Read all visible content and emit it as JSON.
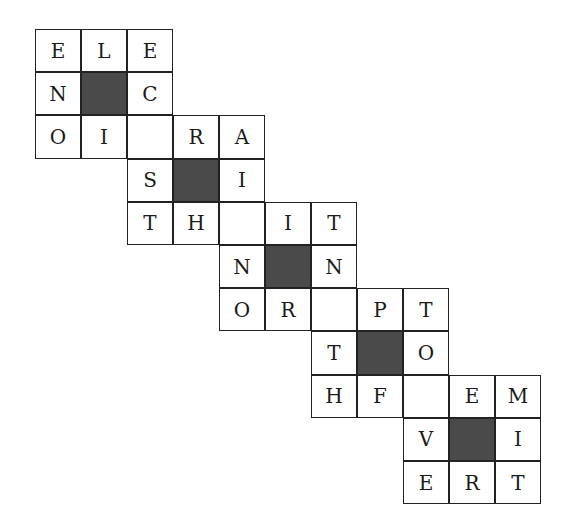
{
  "puzzle": {
    "cell_width": 46,
    "cell_height": 43.2,
    "shade_color": "#4a4a4a",
    "cells": [
      {
        "row": 0,
        "col": 0,
        "letter": "E"
      },
      {
        "row": 0,
        "col": 1,
        "letter": "L"
      },
      {
        "row": 0,
        "col": 2,
        "letter": "E"
      },
      {
        "row": 1,
        "col": 0,
        "letter": "N"
      },
      {
        "row": 1,
        "col": 1,
        "shaded": true
      },
      {
        "row": 1,
        "col": 2,
        "letter": "C"
      },
      {
        "row": 2,
        "col": 0,
        "letter": "O"
      },
      {
        "row": 2,
        "col": 1,
        "letter": "I"
      },
      {
        "row": 2,
        "col": 2,
        "letter": ""
      },
      {
        "row": 2,
        "col": 3,
        "letter": "R"
      },
      {
        "row": 2,
        "col": 4,
        "letter": "A"
      },
      {
        "row": 3,
        "col": 2,
        "letter": "S"
      },
      {
        "row": 3,
        "col": 3,
        "shaded": true
      },
      {
        "row": 3,
        "col": 4,
        "letter": "I"
      },
      {
        "row": 4,
        "col": 2,
        "letter": "T"
      },
      {
        "row": 4,
        "col": 3,
        "letter": "H"
      },
      {
        "row": 4,
        "col": 4,
        "letter": ""
      },
      {
        "row": 4,
        "col": 5,
        "letter": "I"
      },
      {
        "row": 4,
        "col": 6,
        "letter": "T"
      },
      {
        "row": 5,
        "col": 4,
        "letter": "N"
      },
      {
        "row": 5,
        "col": 5,
        "shaded": true
      },
      {
        "row": 5,
        "col": 6,
        "letter": "N"
      },
      {
        "row": 6,
        "col": 4,
        "letter": "O"
      },
      {
        "row": 6,
        "col": 5,
        "letter": "R"
      },
      {
        "row": 6,
        "col": 6,
        "letter": ""
      },
      {
        "row": 6,
        "col": 7,
        "letter": "P"
      },
      {
        "row": 6,
        "col": 8,
        "letter": "T"
      },
      {
        "row": 7,
        "col": 6,
        "letter": "T"
      },
      {
        "row": 7,
        "col": 7,
        "shaded": true
      },
      {
        "row": 7,
        "col": 8,
        "letter": "O"
      },
      {
        "row": 8,
        "col": 6,
        "letter": "H"
      },
      {
        "row": 8,
        "col": 7,
        "letter": "F"
      },
      {
        "row": 8,
        "col": 8,
        "letter": ""
      },
      {
        "row": 8,
        "col": 9,
        "letter": "E"
      },
      {
        "row": 8,
        "col": 10,
        "letter": "M"
      },
      {
        "row": 9,
        "col": 8,
        "letter": "V"
      },
      {
        "row": 9,
        "col": 9,
        "shaded": true
      },
      {
        "row": 9,
        "col": 10,
        "letter": "I"
      },
      {
        "row": 10,
        "col": 8,
        "letter": "E"
      },
      {
        "row": 10,
        "col": 9,
        "letter": "R"
      },
      {
        "row": 10,
        "col": 10,
        "letter": "T"
      }
    ]
  }
}
